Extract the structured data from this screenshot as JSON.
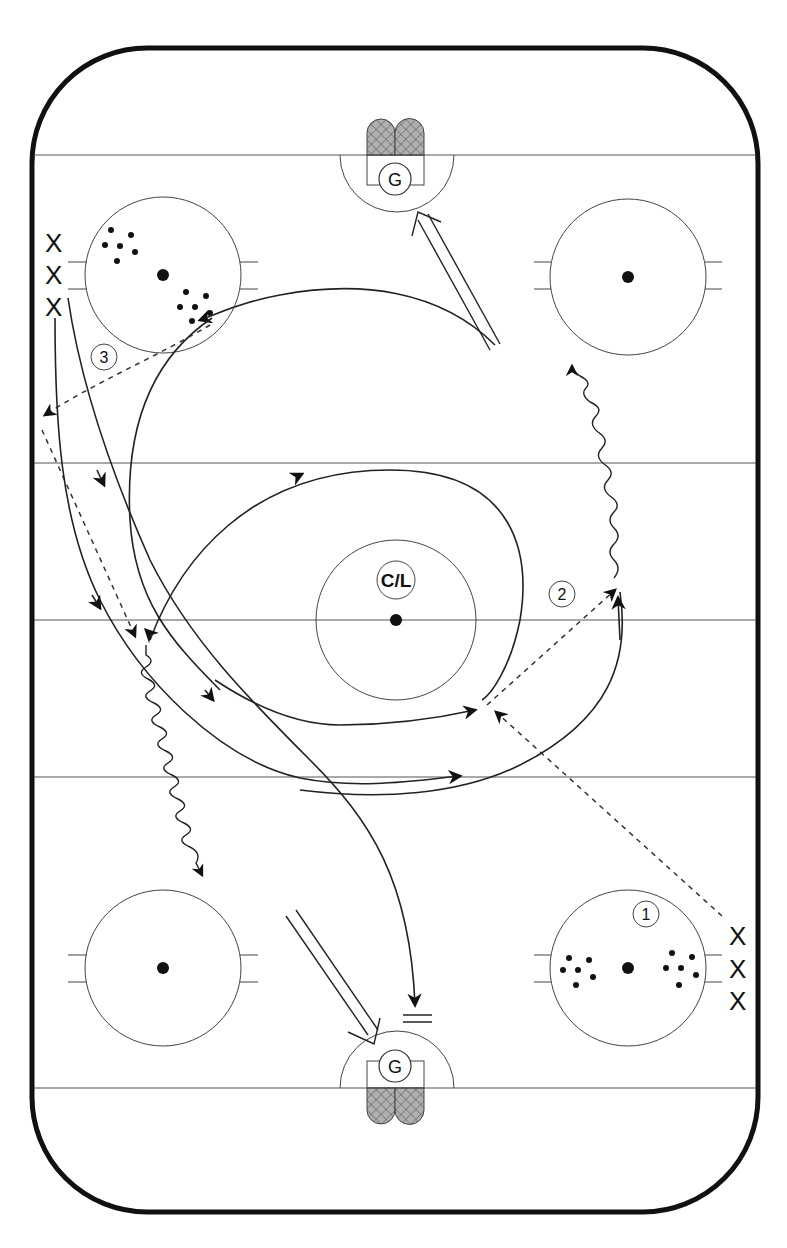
{
  "diagram": {
    "type": "hockey-drill",
    "center_label": "C/L",
    "goalie_label": "G",
    "player_marker": "X",
    "step_labels": [
      "1",
      "2",
      "3"
    ],
    "player_groups": [
      {
        "position": "top-left",
        "markers": [
          "X",
          "X",
          "X"
        ]
      },
      {
        "position": "bottom-right",
        "markers": [
          "X",
          "X",
          "X"
        ]
      }
    ],
    "legend": {
      "solid_arrow": "skate path",
      "dashed_arrow": "pass",
      "wavy_arrow": "skate with puck",
      "double_line_arrow": "shot",
      "double_bar": "stop"
    },
    "colors": {
      "ink": "#111111",
      "lines": "#555555",
      "net_fill": "#9a9a9a",
      "background": "#ffffff"
    }
  }
}
